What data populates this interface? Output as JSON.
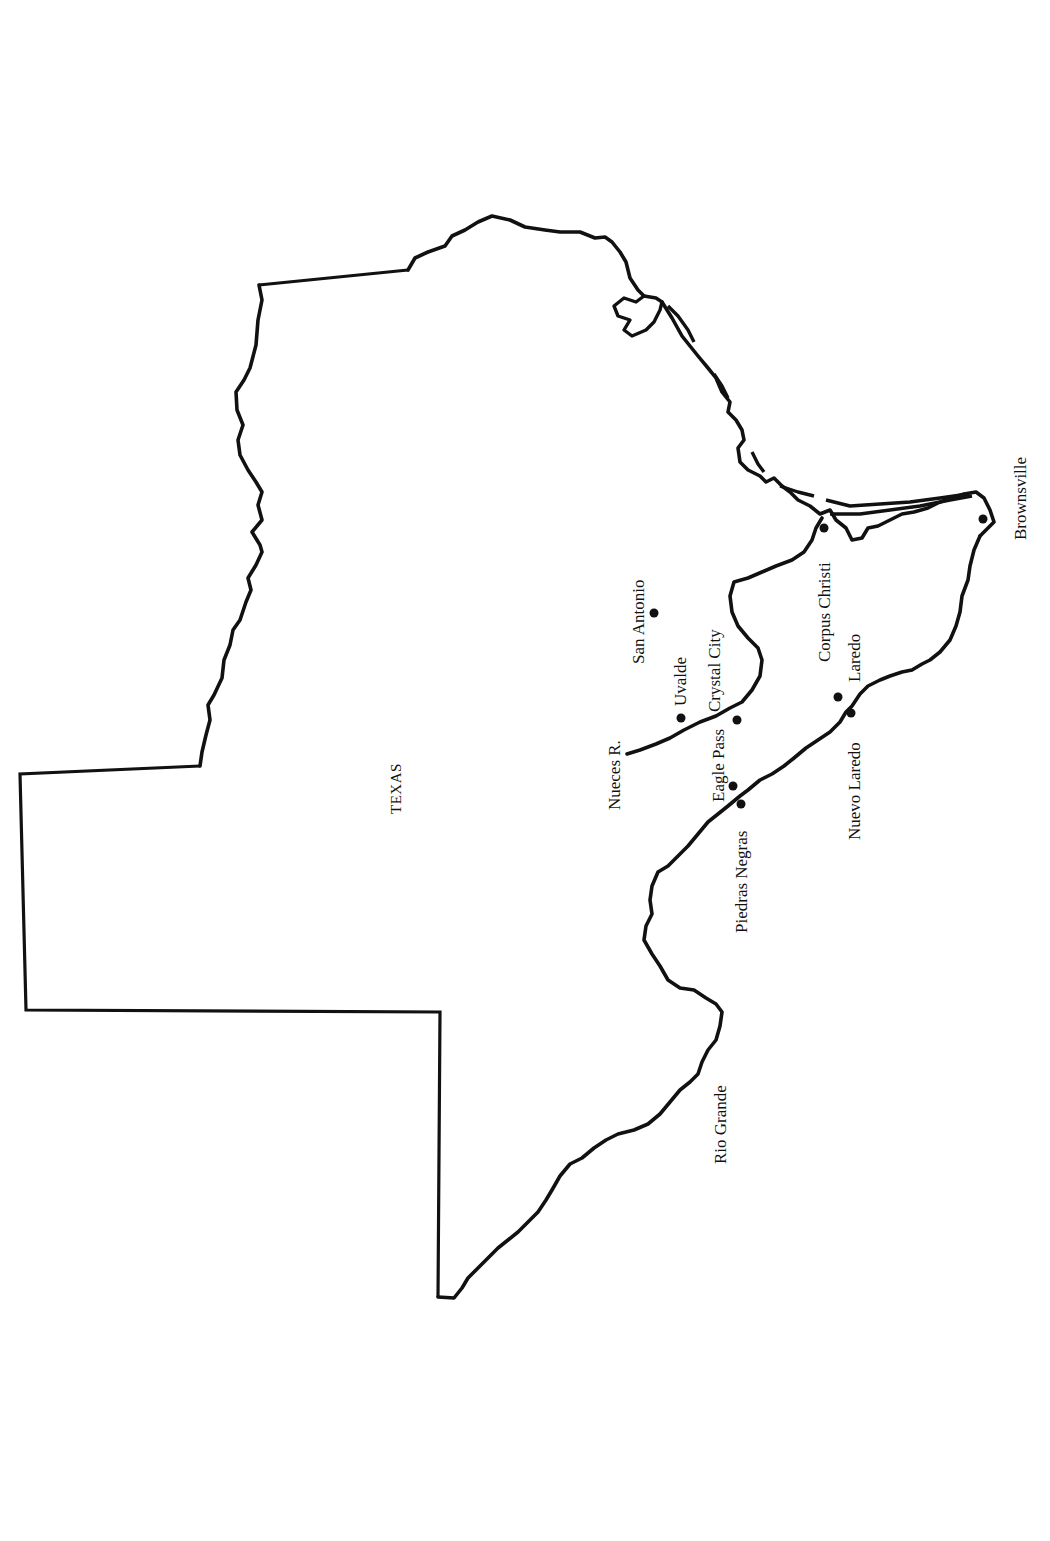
{
  "map": {
    "orientation": "rotated -90deg (north to the left)",
    "state_label": "TEXAS",
    "colors": {
      "ink": "#111111",
      "paper": "#ffffff"
    },
    "cities": [
      {
        "name": "San Antonio",
        "dot": [
          654,
          613
        ]
      },
      {
        "name": "Uvalde",
        "dot": [
          681,
          718
        ]
      },
      {
        "name": "Crystal City",
        "dot": [
          737,
          720
        ]
      },
      {
        "name": "Eagle Pass",
        "dot": [
          733,
          786
        ]
      },
      {
        "name": "Piedras Negras",
        "dot": [
          741,
          804
        ]
      },
      {
        "name": "Corpus Christi",
        "dot": [
          824,
          528
        ]
      },
      {
        "name": "Laredo",
        "dot": [
          838,
          697
        ]
      },
      {
        "name": "Nuevo Laredo",
        "dot": [
          851,
          713
        ]
      },
      {
        "name": "Brownsville",
        "dot": [
          983,
          519
        ]
      }
    ],
    "rivers": [
      {
        "name": "Nueces R."
      },
      {
        "name": "Rio Grande"
      }
    ]
  }
}
